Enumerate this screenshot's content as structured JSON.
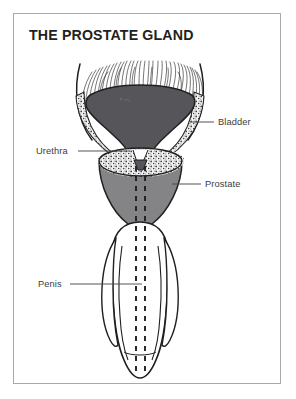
{
  "document": {
    "title": "THE PROSTATE GLAND",
    "background_color": "#ffffff",
    "border_color": "#a9a9ab",
    "title_color": "#231f20",
    "label_color": "#3c3c3e"
  },
  "diagram": {
    "type": "anatomical-illustration",
    "style": "grayscale line drawing with stippling and hatching",
    "palette": {
      "bladder_fill": "#55555a",
      "bladder_wall_stipple": "#f2f2f2",
      "prostate_fill": "#848487",
      "penis_fill": "#ffffff",
      "outline": "#231f20",
      "urethra_dash": "#231f20",
      "fiber_stroke": "#231f20"
    },
    "labels": [
      {
        "id": "bladder",
        "text": "Bladder",
        "side": "right",
        "leader_from_x": 190,
        "leader_to_x": 214,
        "leader_y": 122
      },
      {
        "id": "urethra",
        "text": "Urethra",
        "side": "left",
        "leader_from_x": 78,
        "leader_to_x": 130,
        "leader_y": 151
      },
      {
        "id": "prostate",
        "text": "Prostate",
        "side": "right",
        "leader_from_x": 172,
        "leader_to_x": 201,
        "leader_y": 184
      },
      {
        "id": "penis",
        "text": "Penis",
        "side": "left",
        "leader_from_x": 70,
        "leader_to_x": 142,
        "leader_y": 284
      }
    ],
    "structures": [
      {
        "id": "bladder",
        "name": "Bladder",
        "description": "dark gray dome-shaped organ with radiating muscle fibers above and stippled inner wall lining"
      },
      {
        "id": "urethra",
        "name": "Urethra",
        "description": "central channel drawn as two parallel dashed lines running from bladder neck through prostate and penis"
      },
      {
        "id": "prostate",
        "name": "Prostate",
        "description": "medium gray rounded gland below the bladder, with stippled upper rim"
      },
      {
        "id": "penis",
        "name": "Penis",
        "description": "white outlined elongated shaft with lateral lobes and rounded tip"
      }
    ]
  }
}
